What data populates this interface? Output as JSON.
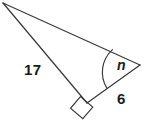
{
  "figure": {
    "kind": "right-triangle-diagram",
    "background_color": "#ffffff",
    "stroke_color": "#3a3a3a",
    "text_color": "#1a1a1a",
    "labels": {
      "hypotenuse_label": "17",
      "adjacent_leg_label": "6",
      "unknown_angle_label": "n"
    },
    "vertices": {
      "apex_top_left": [
        3,
        3
      ],
      "vertex_right": [
        140,
        65
      ],
      "vertex_right_angle": [
        87,
        103
      ]
    },
    "markers": {
      "right_angle_square": "square",
      "angle_arc": "arc"
    }
  }
}
